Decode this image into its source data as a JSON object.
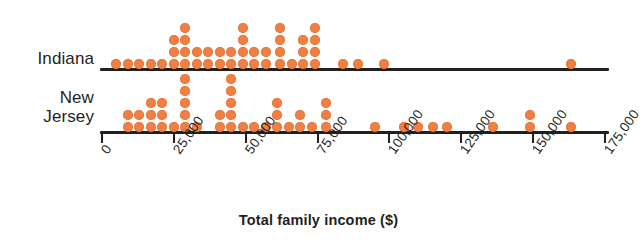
{
  "chart_data": {
    "type": "scatter",
    "plot_kind": "stacked-dot-plot",
    "title": "",
    "xlabel": "Total family income ($)",
    "ylabel": "",
    "xlim": [
      0,
      175000
    ],
    "grid": false,
    "legend_position": "none",
    "dot_color": "#f07f43",
    "axis_color": "#231f20",
    "tick_values": [
      0,
      25000,
      50000,
      75000,
      100000,
      125000,
      150000,
      175000
    ],
    "tick_labels": [
      "0",
      "25,000",
      "50,000",
      "75,000",
      "100,000",
      "125,000",
      "150,000",
      "175,000"
    ],
    "tick_interval": 25000,
    "dot_value_per_dot": 1,
    "groups": [
      {
        "name": "Indiana",
        "label_lines": [
          "Indiana"
        ],
        "stacks": [
          {
            "x": 5000,
            "count": 1
          },
          {
            "x": 9000,
            "count": 1
          },
          {
            "x": 13000,
            "count": 1
          },
          {
            "x": 17000,
            "count": 1
          },
          {
            "x": 21000,
            "count": 1
          },
          {
            "x": 25000,
            "count": 3
          },
          {
            "x": 29000,
            "count": 4
          },
          {
            "x": 33000,
            "count": 2
          },
          {
            "x": 37000,
            "count": 2
          },
          {
            "x": 41000,
            "count": 2
          },
          {
            "x": 45000,
            "count": 2
          },
          {
            "x": 49000,
            "count": 4
          },
          {
            "x": 53000,
            "count": 2
          },
          {
            "x": 57000,
            "count": 2
          },
          {
            "x": 62000,
            "count": 4
          },
          {
            "x": 66000,
            "count": 1
          },
          {
            "x": 70000,
            "count": 3
          },
          {
            "x": 74000,
            "count": 4
          },
          {
            "x": 84000,
            "count": 1
          },
          {
            "x": 89000,
            "count": 1
          },
          {
            "x": 98000,
            "count": 1
          },
          {
            "x": 163000,
            "count": 1
          }
        ],
        "total_dots": 44
      },
      {
        "name": "New Jersey",
        "label_lines": [
          "New",
          "Jersey"
        ],
        "stacks": [
          {
            "x": 9000,
            "count": 2
          },
          {
            "x": 13000,
            "count": 2
          },
          {
            "x": 17000,
            "count": 3
          },
          {
            "x": 21000,
            "count": 3
          },
          {
            "x": 25000,
            "count": 1
          },
          {
            "x": 29000,
            "count": 5
          },
          {
            "x": 33000,
            "count": 1
          },
          {
            "x": 41000,
            "count": 2
          },
          {
            "x": 45000,
            "count": 5
          },
          {
            "x": 49000,
            "count": 1
          },
          {
            "x": 53000,
            "count": 1
          },
          {
            "x": 57000,
            "count": 1
          },
          {
            "x": 61000,
            "count": 3
          },
          {
            "x": 65000,
            "count": 1
          },
          {
            "x": 69000,
            "count": 2
          },
          {
            "x": 73000,
            "count": 1
          },
          {
            "x": 78000,
            "count": 3
          },
          {
            "x": 95000,
            "count": 1
          },
          {
            "x": 105000,
            "count": 1
          },
          {
            "x": 110000,
            "count": 1
          },
          {
            "x": 115000,
            "count": 1
          },
          {
            "x": 120000,
            "count": 1
          },
          {
            "x": 136000,
            "count": 1
          },
          {
            "x": 149000,
            "count": 2
          },
          {
            "x": 163000,
            "count": 1
          }
        ],
        "total_dots": 46
      }
    ]
  },
  "axis": {
    "title": "Total family income ($)"
  }
}
